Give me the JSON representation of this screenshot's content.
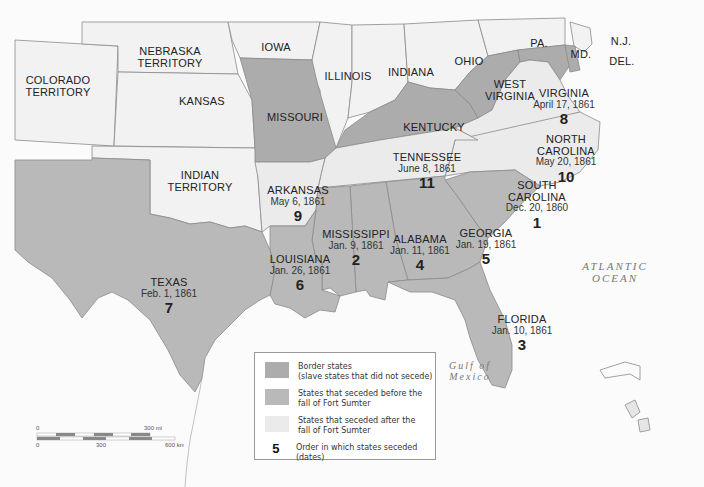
{
  "colors": {
    "background": "#fbfbfb",
    "non_slave_state": "#f2f2f2",
    "seceded_after_sumter": "#ebebeb",
    "seceded_before_sumter": "#b9b9b9",
    "border_state": "#acacac",
    "boundary": "#8a8a8a"
  },
  "labels": {
    "colorado": "COLORADO TERRITORY",
    "colorado_l1": "COLORADO",
    "colorado_l2": "TERRITORY",
    "nebraska_l1": "NEBRASKA",
    "nebraska_l2": "TERRITORY",
    "kansas": "KANSAS",
    "iowa": "IOWA",
    "missouri": "MISSOURI",
    "illinois": "ILLINOIS",
    "indiana": "INDIANA",
    "ohio": "OHIO",
    "pa": "PA.",
    "nj": "N.J.",
    "md": "MD.",
    "del": "DEL.",
    "west_virginia_l1": "WEST",
    "west_virginia_l2": "VIRGINIA",
    "kentucky": "KENTUCKY",
    "indian_territory_l1": "INDIAN",
    "indian_territory_l2": "TERRITORY"
  },
  "seceded_states": [
    {
      "name": "SOUTH CAROLINA",
      "l1": "SOUTH",
      "l2": "CAROLINA",
      "date": "Dec. 20, 1860",
      "order": "1"
    },
    {
      "name": "MISSISSIPPI",
      "date": "Jan. 9, 1861",
      "order": "2"
    },
    {
      "name": "FLORIDA",
      "date": "Jan. 10, 1861",
      "order": "3"
    },
    {
      "name": "ALABAMA",
      "date": "Jan. 11, 1861",
      "order": "4"
    },
    {
      "name": "GEORGIA",
      "date": "Jan. 19, 1861",
      "order": "5"
    },
    {
      "name": "LOUISIANA",
      "date": "Jan. 26, 1861",
      "order": "6"
    },
    {
      "name": "TEXAS",
      "date": "Feb. 1, 1861",
      "order": "7"
    },
    {
      "name": "VIRGINIA",
      "date": "April 17, 1861",
      "order": "8"
    },
    {
      "name": "ARKANSAS",
      "date": "May 6, 1861",
      "order": "9"
    },
    {
      "name": "NORTH CAROLINA",
      "l1": "NORTH",
      "l2": "CAROLINA",
      "date": "May 20, 1861",
      "order": "10"
    },
    {
      "name": "TENNESSEE",
      "date": "June 8, 1861",
      "order": "11"
    }
  ],
  "water": {
    "atlantic_l1": "ATLANTIC",
    "atlantic_l2": "OCEAN",
    "gulf_l1": "Gulf of",
    "gulf_l2": "Mexico"
  },
  "legend": {
    "items": [
      {
        "text_l1": "Border states",
        "text_l2": "(slave states that did not secede)"
      },
      {
        "text_l1": "States that seceded before the",
        "text_l2": "fall of Fort Sumter"
      },
      {
        "text_l1": "States that seceded after the",
        "text_l2": "fall of Fort Sumter"
      },
      {
        "symbol": "5",
        "text_l1": "Order in which states seceded (dates)"
      }
    ]
  },
  "scale_bar": {
    "mi_start": "0",
    "mi_end": "300 mi",
    "km_start": "0",
    "km_mid": "300",
    "km_end": "600 km"
  }
}
